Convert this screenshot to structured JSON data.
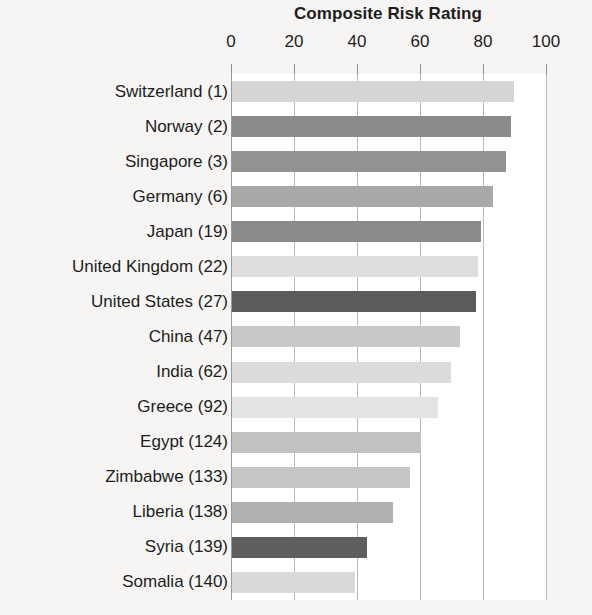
{
  "chart_data": {
    "type": "bar",
    "orientation": "horizontal",
    "title": "Composite Risk Rating",
    "xlabel": "",
    "ylabel": "",
    "xlim": [
      0,
      100
    ],
    "xticks": [
      0,
      20,
      40,
      60,
      80,
      100
    ],
    "xtick_labels": [
      "0",
      "20",
      "40",
      "60",
      "80",
      "100"
    ],
    "grid": true,
    "grid_axis": "x",
    "legend": false,
    "categories": [
      "Switzerland (1)",
      "Norway (2)",
      "Singapore (3)",
      "Germany (6)",
      "Japan (19)",
      "United Kingdom (22)",
      "United States (27)",
      "China (47)",
      "India (62)",
      "Greece (92)",
      "Egypt (124)",
      "Zimbabwe (133)",
      "Liberia (138)",
      "Syria (139)",
      "Somalia (140)"
    ],
    "values": [
      89.5,
      88.5,
      87,
      83,
      79,
      78,
      77.5,
      72.5,
      69.5,
      65.5,
      60,
      56.5,
      51,
      43,
      39
    ],
    "bar_colors": [
      "#d6d6d6",
      "#8b8b8b",
      "#939393",
      "#a9a9a9",
      "#8a8a8a",
      "#dedede",
      "#5b5b5b",
      "#c9c9c9",
      "#dcdcdc",
      "#e3e3e3",
      "#c1c1c1",
      "#c6c6c6",
      "#b1b1b1",
      "#5f5f5f",
      "#d9d9d9"
    ],
    "background_color": "#f6f5f3",
    "plot_background_color": "#ffffff",
    "gridline_color": "#b9b9b9",
    "text_color": "#1d1d1d"
  }
}
